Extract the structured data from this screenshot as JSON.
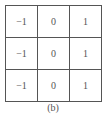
{
  "kernel": {
    "rows": [
      [
        "−1",
        "0",
        "1"
      ],
      [
        "−1",
        "0",
        "1"
      ],
      [
        "−1",
        "0",
        "1"
      ]
    ]
  },
  "caption": "(b)"
}
